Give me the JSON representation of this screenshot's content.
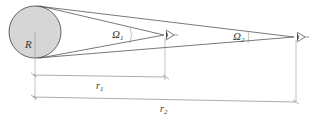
{
  "diagram": {
    "sphere": {
      "label": "R",
      "fill": "#d6d6d6",
      "stroke": "#555555"
    },
    "observer1": {
      "angle_label": "Ω",
      "angle_sub": "1"
    },
    "observer2": {
      "angle_label": "Ω",
      "angle_sub": "2"
    },
    "dimensions": [
      {
        "label": "r",
        "sub": "1"
      },
      {
        "label": "r",
        "sub": "2"
      }
    ],
    "line_color": "#555555",
    "guide_color": "#999999"
  }
}
